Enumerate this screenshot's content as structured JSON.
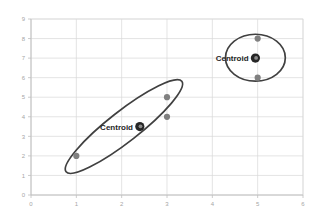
{
  "chart_data": {
    "type": "scatter",
    "title": "",
    "xlabel": "",
    "ylabel": "",
    "xlim": [
      0,
      6
    ],
    "ylim": [
      0,
      9
    ],
    "x_ticks": [
      "0",
      "1",
      "2",
      "3",
      "4",
      "5",
      "6"
    ],
    "y_ticks": [
      "0",
      "1",
      "2",
      "3",
      "4",
      "5",
      "6",
      "7",
      "8",
      "9"
    ],
    "grid": true,
    "legend": "none",
    "colors": {
      "point": "#808080",
      "centroid": "#262626",
      "centroid_highlight": "#8c8c8c",
      "ellipse": "#404040",
      "gridline": "#d9d9d9",
      "tick_text": "#a6a6a6",
      "label_text": "#262626",
      "background": "#ffffff"
    },
    "series": [
      {
        "name": "cluster-1-points",
        "marker": "circle",
        "color": "#808080",
        "points": [
          {
            "x": 1,
            "y": 2
          },
          {
            "x": 3,
            "y": 5
          },
          {
            "x": 3,
            "y": 4
          }
        ]
      },
      {
        "name": "cluster-2-points",
        "marker": "circle",
        "color": "#808080",
        "points": [
          {
            "x": 5,
            "y": 8
          },
          {
            "x": 5,
            "y": 6
          }
        ]
      }
    ],
    "centroids": [
      {
        "name": "cluster-1-centroid",
        "label": "Centroid",
        "x": 2.4,
        "y": 3.5
      },
      {
        "name": "cluster-2-centroid",
        "label": "Centroid",
        "x": 4.95,
        "y": 7
      }
    ],
    "cluster_outlines": [
      {
        "name": "cluster-1-ellipse",
        "shape": "ellipse",
        "cx": 2.05,
        "cy": 3.5,
        "rx": 1.62,
        "ry": 0.78,
        "rotation_deg": -38
      },
      {
        "name": "cluster-2-ellipse",
        "shape": "ellipse",
        "cx": 4.95,
        "cy": 7.02,
        "rx": 0.66,
        "ry": 1.2,
        "rotation_deg": 0
      }
    ],
    "annotations": [
      {
        "name": "cluster-1-centroid-label",
        "text": "Centroid",
        "x": 2.25,
        "y": 3.5,
        "anchor": "end"
      },
      {
        "name": "cluster-2-centroid-label",
        "text": "Centroid",
        "x": 4.8,
        "y": 7.0,
        "anchor": "end"
      }
    ]
  }
}
